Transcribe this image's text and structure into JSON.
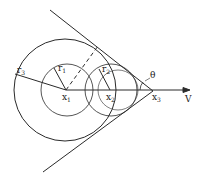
{
  "labels": {
    "r1": "r",
    "r1_sub": "1",
    "r2": "r",
    "r2_sub": "2",
    "r3": "r",
    "r3_sub": "3",
    "x1": "x",
    "x1_sub": "1",
    "x2": "x",
    "x2_sub": "2",
    "x3": "x",
    "x3_sub": "3",
    "theta": "θ",
    "v": "V"
  },
  "colors": {
    "stroke": "#2a2a2a",
    "background": "#ffffff"
  }
}
